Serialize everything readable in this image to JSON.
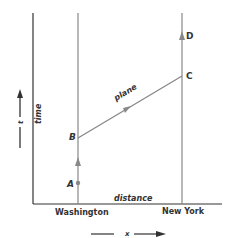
{
  "axes": {
    "time_label": "time",
    "time_arrow_label": "t",
    "distance_label": "distance",
    "x_arrow_label": "x"
  },
  "locations": {
    "left": "Washington",
    "right": "New York"
  },
  "events": {
    "A": "A",
    "B": "B",
    "C": "C",
    "D": "D"
  },
  "path_label": "plane",
  "colors": {
    "axis": "#333333",
    "worldline": "#888888",
    "text": "#333333"
  }
}
